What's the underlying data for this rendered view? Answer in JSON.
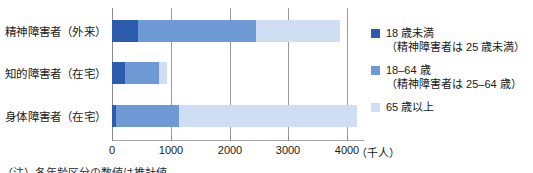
{
  "chart_data": {
    "type": "bar",
    "orientation": "horizontal",
    "stacked": true,
    "title": "",
    "xlabel": "(千人)",
    "ylabel": "",
    "xlim": [
      0,
      4400
    ],
    "xticks": [
      0,
      1000,
      2000,
      3000,
      4000
    ],
    "xtick_labels": [
      "0",
      "1000",
      "2000",
      "3000",
      "4000"
    ],
    "grid": true,
    "legend_position": "right",
    "categories": [
      "精神障害者（外来）",
      "知的障害者（在宅）",
      "身体障害者（在宅）"
    ],
    "series": [
      {
        "name": "18 歳未満",
        "note": "（精神障害者は 25 歳未満）",
        "color": "#2d5cad",
        "values": [
          440,
          220,
          60
        ]
      },
      {
        "name": "18–64 歳",
        "note": "（精神障害者は 25–64 歳）",
        "color": "#6e99d4",
        "values": [
          2010,
          580,
          1080
        ]
      },
      {
        "name": "65 歳以上",
        "note": "",
        "color": "#cfdef2",
        "values": [
          1430,
          140,
          3030
        ]
      }
    ],
    "totals": [
      3880,
      940,
      4170
    ]
  },
  "legend": {
    "items": [
      {
        "label": "18 歳未満",
        "sub": "（精神障害者は 25 歳未満）",
        "color": "#2d5cad"
      },
      {
        "label": "18–64 歳",
        "sub": "（精神障害者は 25–64 歳）",
        "color": "#6e99d4"
      },
      {
        "label": "65 歳以上",
        "sub": "",
        "color": "#cfdef2"
      }
    ]
  },
  "axis": {
    "unit": "（千人）"
  },
  "footnote": {
    "text": "（注）各年齢区分の数値は推計値"
  }
}
